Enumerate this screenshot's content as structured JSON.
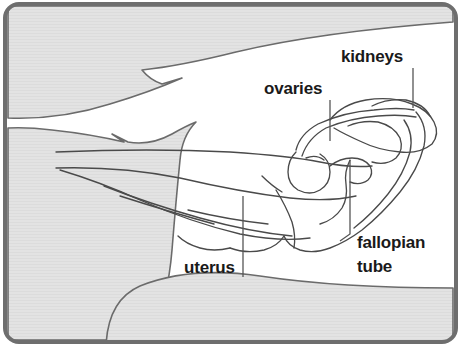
{
  "figure": {
    "width": 461,
    "height": 346,
    "frame": {
      "border_color": "#6e6e6e",
      "corner_radius": 14,
      "background_color": "#ffffff"
    },
    "colors": {
      "body_fill": "#e3e3e3",
      "body_outline": "#6b6b6b",
      "organ_outline": "#4a4a4a",
      "leader_line": "#555555",
      "label_text": "#1a1a1a",
      "interior_fill": "#ffffff"
    },
    "labels": [
      {
        "id": "kidneys",
        "text": "kidneys",
        "x": 341,
        "y": 62,
        "anchor": "start",
        "leader": "M413,68 L413,108"
      },
      {
        "id": "ovaries",
        "text": "ovaries",
        "x": 264,
        "y": 94,
        "anchor": "start",
        "leader": "M330,100 L330,141"
      },
      {
        "id": "fallopian-tube",
        "text": "fallopian",
        "x": 357,
        "y": 248,
        "anchor": "start",
        "leader": "M350,160 L350,234 L340,241"
      },
      {
        "id": "fallopian-tube-line2",
        "text": "tube",
        "x": 357,
        "y": 272,
        "anchor": "start",
        "leader": ""
      },
      {
        "id": "uterus",
        "text": "uterus",
        "x": 184,
        "y": 273,
        "anchor": "start",
        "leader": "M243,196 L243,277"
      }
    ],
    "body_shapes": [
      {
        "id": "upper-back",
        "name": "upper-body-wall",
        "path": "M8,14 L8,118 Q60,120 110,104 Q150,92 182,78 L162,84 Q150,80 142,70 Q180,66 236,52 Q320,32 453,22 L453,10 Q453,6 447,6 L14,6 Q8,6 8,14 Z"
      },
      {
        "id": "left-leg",
        "name": "left-hindquarter",
        "path": "M8,128 L8,340 L150,340 Q168,300 172,250 Q176,200 180,160 Q182,136 196,122 Q186,126 172,134 Q150,146 128,142 L112,134 L124,142 Q90,134 52,130 Q28,127 8,128 Z"
      },
      {
        "id": "lower-right",
        "name": "lower-body-wall",
        "path": "M106,346 Q108,300 140,286 Q190,266 260,276 Q340,288 453,288 L453,340 Q453,346 447,346 Z"
      }
    ],
    "organ_paths": [
      "M56,152 Q150,148 230,152 Q290,156 320,162 Q350,168 372,166",
      "M56,168 Q120,166 180,178 Q240,192 290,198 Q330,202 356,196",
      "M60,170 Q100,182 140,200 Q190,222 240,234 Q280,242 310,238",
      "M104,186 Q150,204 200,218 Q250,232 292,236",
      "M120,196 Q170,212 214,224",
      "M188,210 Q230,220 268,224",
      "M296,150 Q300,134 318,124 Q344,112 374,110 Q398,107 414,110",
      "M302,156 Q308,138 326,128 Q350,118 378,116 Q400,114 416,117",
      "M330,120 Q342,104 366,100 Q392,96 412,104 Q428,110 434,122 Q440,134 432,144 Q420,154 400,152 Q378,150 362,142 Q344,134 334,128",
      "M372,106 Q388,98 406,100 Q424,104 430,116",
      "M348,126 Q362,120 378,122 Q394,126 400,138 Q404,150 396,158 Q386,166 372,162",
      "M296,152 Q288,160 288,172 Q288,184 298,190 Q310,196 320,190 Q330,184 330,172 Q330,160 320,154",
      "M306,158 Q316,154 324,160",
      "M330,166 Q340,158 352,158 Q364,158 370,166 Q374,174 368,180 Q360,186 350,182",
      "M350,160 Q344,172 346,184 Q348,198 342,208 Q334,220 320,224",
      "M416,112 Q428,126 424,146 Q418,170 400,192 Q382,214 362,230 Q346,242 330,248 Q314,254 300,250 Q288,246 284,236",
      "M404,120 Q414,134 410,152 Q404,174 388,194 Q372,214 354,228",
      "M284,236 Q278,246 264,250 Q246,254 230,248",
      "M276,190 Q286,206 292,222 Q296,236 294,248",
      "M262,176 Q272,186 282,192",
      "M230,248 Q214,252 200,248 Q186,244 178,236"
    ]
  }
}
